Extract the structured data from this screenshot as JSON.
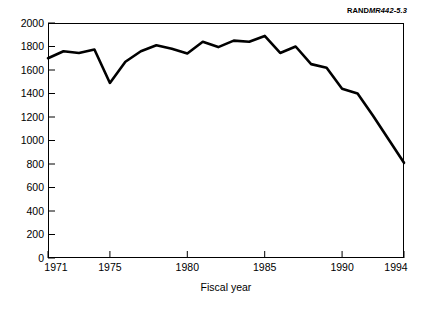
{
  "source_credit": {
    "brand": "RAND",
    "figure_id": "MR442-5.3"
  },
  "chart_data": {
    "type": "line",
    "title": "",
    "subtitle": "",
    "xlabel": "Fiscal year",
    "ylabel": "",
    "grid": false,
    "legend": "none",
    "xlim": [
      1971,
      1994
    ],
    "ylim": [
      0,
      2000
    ],
    "xticks": [
      1971,
      1975,
      1980,
      1985,
      1990,
      1994
    ],
    "xtick_labels": [
      "1971",
      "1975",
      "1980",
      "1985",
      "1990",
      "1994"
    ],
    "yticks": [
      0,
      200,
      400,
      600,
      800,
      1000,
      1200,
      1400,
      1600,
      1800,
      2000
    ],
    "ytick_labels": [
      "0",
      "200",
      "400",
      "600",
      "800",
      "1000",
      "1200",
      "1400",
      "1600",
      "1800",
      "2000"
    ],
    "line_color": "#000000",
    "line_width": 2.6,
    "x": [
      1971,
      1972,
      1973,
      1974,
      1975,
      1976,
      1977,
      1978,
      1979,
      1980,
      1981,
      1982,
      1983,
      1984,
      1985,
      1986,
      1987,
      1988,
      1989,
      1990,
      1991,
      1992,
      1993,
      1994
    ],
    "series": [
      {
        "name": "Fiscal year value",
        "values": [
          1700,
          1760,
          1745,
          1775,
          1490,
          1670,
          1760,
          1810,
          1780,
          1740,
          1840,
          1795,
          1850,
          1840,
          1890,
          1745,
          1800,
          1650,
          1620,
          1440,
          1400,
          1210,
          1010,
          810
        ]
      }
    ]
  }
}
